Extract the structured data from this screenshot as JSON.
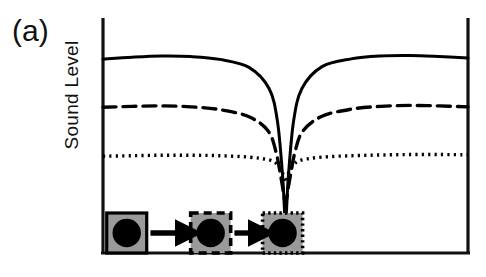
{
  "figure": {
    "panel_label": "(a)",
    "y_axis_label": "Sound Level",
    "x_axis_label": ""
  },
  "chart_data": {
    "type": "line",
    "title": "",
    "xlabel": "",
    "ylabel": "Sound Level",
    "xlim": [
      0,
      1
    ],
    "ylim": [
      0,
      1
    ],
    "grid": false,
    "legend": "none",
    "axes_pixels": {
      "left": 103,
      "right": 468,
      "top": 18,
      "bottom": 253,
      "center_x": 281
    },
    "series": [
      {
        "name": "solid",
        "style": "solid",
        "color": "#000000",
        "edge_level": 0.825,
        "notch_depth": 0.14,
        "notch_half_width": 0.075,
        "x": [
          0.0,
          0.08,
          0.16,
          0.24,
          0.32,
          0.4,
          0.455,
          0.478,
          0.492,
          0.5,
          0.508,
          0.522,
          0.545,
          0.6,
          0.68,
          0.76,
          0.84,
          0.92,
          1.0
        ],
        "y": [
          0.825,
          0.833,
          0.838,
          0.836,
          0.824,
          0.79,
          0.7,
          0.56,
          0.33,
          0.14,
          0.33,
          0.56,
          0.7,
          0.793,
          0.826,
          0.838,
          0.84,
          0.836,
          0.83
        ]
      },
      {
        "name": "dashed",
        "style": "dashed",
        "color": "#000000",
        "edge_level": 0.62,
        "notch_depth": 0.215,
        "notch_half_width": 0.055,
        "x": [
          0.0,
          0.08,
          0.16,
          0.24,
          0.32,
          0.4,
          0.452,
          0.474,
          0.49,
          0.5,
          0.51,
          0.526,
          0.548,
          0.6,
          0.68,
          0.76,
          0.84,
          0.92,
          1.0
        ],
        "y": [
          0.62,
          0.624,
          0.626,
          0.622,
          0.61,
          0.58,
          0.52,
          0.43,
          0.3,
          0.215,
          0.3,
          0.43,
          0.52,
          0.582,
          0.612,
          0.624,
          0.628,
          0.626,
          0.622
        ]
      },
      {
        "name": "dotted",
        "style": "dotted",
        "color": "#000000",
        "edge_level": 0.412,
        "notch_depth": 0.3,
        "notch_half_width": 0.034,
        "x": [
          0.0,
          0.08,
          0.16,
          0.24,
          0.32,
          0.4,
          0.455,
          0.478,
          0.492,
          0.5,
          0.508,
          0.522,
          0.545,
          0.6,
          0.68,
          0.76,
          0.84,
          0.92,
          1.0
        ],
        "y": [
          0.412,
          0.414,
          0.416,
          0.416,
          0.414,
          0.408,
          0.396,
          0.376,
          0.34,
          0.3,
          0.34,
          0.376,
          0.396,
          0.408,
          0.414,
          0.417,
          0.419,
          0.419,
          0.418
        ]
      }
    ],
    "objects": [
      {
        "name": "object-1",
        "border_style": "solid",
        "x_center": 0.065,
        "fill": "#9a9a9a",
        "dot": "#000000"
      },
      {
        "name": "object-2",
        "border_style": "dashed",
        "x_center": 0.295,
        "fill": "#9a9a9a",
        "dot": "#000000"
      },
      {
        "name": "object-3",
        "border_style": "dotted",
        "x_center": 0.492,
        "fill": "#9a9a9a",
        "dot": "#000000"
      }
    ],
    "arrows": [
      {
        "name": "arrow-1",
        "from": 0.13,
        "to": 0.245
      },
      {
        "name": "arrow-2",
        "from": 0.36,
        "to": 0.445
      }
    ]
  }
}
